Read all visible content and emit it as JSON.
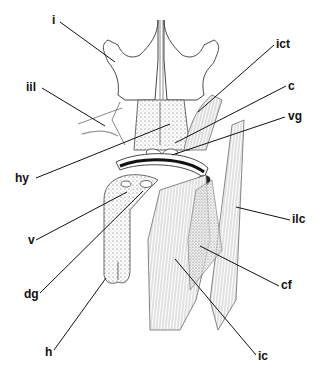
{
  "figure": {
    "type": "anatomical line drawing",
    "background": "#ffffff",
    "ink": "#1a1a1a",
    "labels": [
      {
        "id": "i",
        "text": "i",
        "x": 52,
        "y": 14,
        "target": [
          115,
          62
        ]
      },
      {
        "id": "iil",
        "text": "iil",
        "x": 26,
        "y": 81,
        "target": [
          105,
          126
        ]
      },
      {
        "id": "hy",
        "text": "hy",
        "x": 15,
        "y": 172,
        "target": [
          170,
          124
        ]
      },
      {
        "id": "v",
        "text": "v",
        "x": 28,
        "y": 234,
        "target": [
          127,
          192
        ]
      },
      {
        "id": "dg",
        "text": "dg",
        "x": 24,
        "y": 288,
        "target": [
          143,
          191
        ]
      },
      {
        "id": "h",
        "text": "h",
        "x": 45,
        "y": 346,
        "target": [
          106,
          278
        ]
      },
      {
        "id": "ict",
        "text": "ict",
        "x": 276,
        "y": 38,
        "target": [
          198,
          112
        ]
      },
      {
        "id": "c",
        "text": "c",
        "x": 288,
        "y": 80,
        "target": [
          175,
          143
        ]
      },
      {
        "id": "vg",
        "text": "vg",
        "x": 288,
        "y": 110,
        "target": [
          172,
          155
        ]
      },
      {
        "id": "ilc",
        "text": "ilc",
        "x": 292,
        "y": 213,
        "target": [
          236,
          207
        ]
      },
      {
        "id": "cf",
        "text": "cf",
        "x": 281,
        "y": 279,
        "target": [
          200,
          246
        ]
      },
      {
        "id": "ic",
        "text": "ic",
        "x": 258,
        "y": 350,
        "target": [
          175,
          259
        ]
      }
    ]
  }
}
